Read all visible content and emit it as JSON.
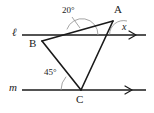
{
  "figure": {
    "type": "geometry-diagram",
    "width": 154,
    "height": 113,
    "background_color": "#ffffff",
    "stroke_color": "#1a1a1a",
    "arc_color": "#8a8a8a"
  },
  "lines": {
    "line_l": {
      "label": "ℓ",
      "label_x": 12,
      "label_y": 28,
      "y": 35,
      "x_start": 22,
      "x_end": 146,
      "has_arrowhead": true,
      "arrow_x": 134
    },
    "line_m": {
      "label": "m",
      "label_x": 10,
      "label_y": 83,
      "y": 90,
      "x_start": 22,
      "x_end": 146,
      "has_arrowhead": true,
      "arrow_x": 130
    }
  },
  "vertices": [
    {
      "name": "A",
      "label": "A",
      "x": 113,
      "y": 21,
      "label_x": 114,
      "label_y": 5
    },
    {
      "name": "B",
      "label": "B",
      "x": 42,
      "y": 41,
      "label_x": 30,
      "label_y": 40
    },
    {
      "name": "C",
      "label": "C",
      "x": 81,
      "y": 90,
      "label_x": 77,
      "label_y": 94
    }
  ],
  "segments": [
    {
      "name": "segment-BA",
      "from": "B",
      "to": "A"
    },
    {
      "name": "segment-BC",
      "from": "B",
      "to": "C"
    },
    {
      "name": "segment-AC",
      "from": "A",
      "to": "C"
    }
  ],
  "angles": [
    {
      "name": "angle-20-at-l-BA",
      "label": "20°",
      "value": "20",
      "unit": "degrees",
      "label_x": 63,
      "label_y": 8,
      "vertex_x": 82,
      "vertex_y": 35,
      "arc_radius": 16,
      "leader_from_x": 72,
      "leader_from_y": 17,
      "leader_to_x": 80,
      "leader_to_y": 27
    },
    {
      "name": "angle-x-at-A",
      "label": "x",
      "value": "x",
      "unit": "unknown",
      "label_x": 123,
      "label_y": 24,
      "vertex_x": 113,
      "vertex_y": 21,
      "arc_radius": 14
    },
    {
      "name": "angle-45-at-C",
      "label": "45°",
      "value": "45",
      "unit": "degrees",
      "label_x": 45,
      "label_y": 70,
      "vertex_x": 81,
      "vertex_y": 90,
      "arc_radius": 20
    }
  ]
}
